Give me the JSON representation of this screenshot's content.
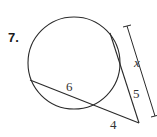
{
  "problem": {
    "number": "7."
  },
  "diagram": {
    "labels": {
      "chord_segment": "6",
      "external_segment": "4",
      "tangent_part": "5",
      "total_length": "x"
    },
    "colors": {
      "stroke": "#2a2a2a",
      "background": "#ffffff"
    }
  }
}
